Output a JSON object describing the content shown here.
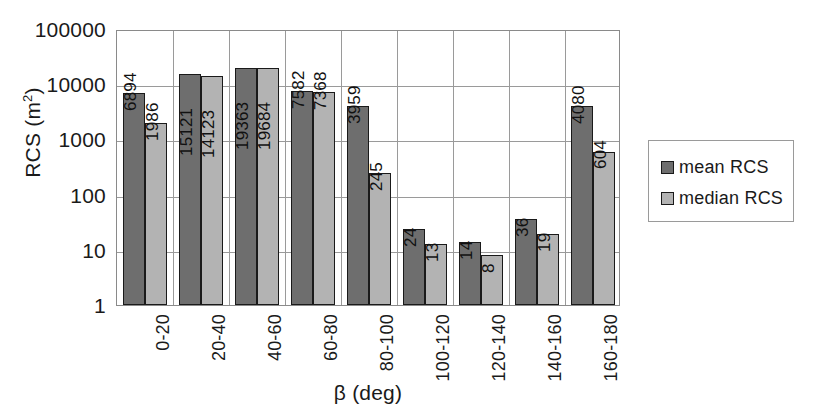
{
  "chart_data": {
    "type": "bar",
    "title": "",
    "subtitle": "",
    "xlabel": "β (deg)",
    "ylabel": "RCS (m²)",
    "ylabel_base": "RCS (m",
    "ylabel_sup": "2",
    "ylabel_tail": ")",
    "yscale": "log",
    "ylim": [
      1,
      100000
    ],
    "ytick_labels": [
      "1",
      "10",
      "100",
      "1000",
      "10000",
      "100000"
    ],
    "ytick_values": [
      1,
      10,
      100,
      1000,
      10000,
      100000
    ],
    "grid": "horizontal-and-vertical",
    "legend_position": "right",
    "categories": [
      "0-20",
      "20-40",
      "40-60",
      "60-80",
      "80-100",
      "100-120",
      "120-140",
      "140-160",
      "160-180"
    ],
    "series": [
      {
        "name": "mean RCS",
        "color": "#6e6e6e",
        "values": [
          6894,
          15121,
          19363,
          7582,
          3959,
          24,
          14,
          36,
          4080
        ],
        "labels": [
          "6894",
          "15121",
          "19363",
          "7582",
          "3959",
          "24",
          "14",
          "36",
          "4080"
        ]
      },
      {
        "name": "median RCS",
        "color": "#b3b3b3",
        "values": [
          1986,
          14123,
          19684,
          7368,
          245,
          13,
          8,
          19,
          604
        ],
        "labels": [
          "1986",
          "14123",
          "19684",
          "7368",
          "245",
          "13",
          "8",
          "19",
          "604"
        ]
      }
    ]
  },
  "legend": {
    "items": [
      {
        "label": "mean RCS",
        "color": "#6e6e6e"
      },
      {
        "label": "median RCS",
        "color": "#b3b3b3"
      }
    ]
  }
}
